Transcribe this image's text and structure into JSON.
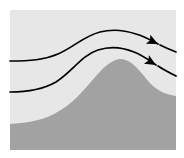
{
  "figure": {
    "type": "schematic-diagram",
    "width": 184,
    "height": 158
  },
  "canvas": {
    "outer_background": "#ffffff",
    "panel": {
      "label": "diagram-panel",
      "x": 10,
      "y": 10,
      "width": 166,
      "height": 140,
      "fill": "#e7e7e7"
    }
  },
  "colors": {
    "sky": "#e7e7e7",
    "terrain": "#a2a2a2",
    "streamline": "#000000",
    "arrowhead": "#000000",
    "background": "#ffffff"
  },
  "terrain": {
    "name": "mountain-ridge",
    "fill": "#a2a2a2",
    "description": "Broad asymmetric hill rising from a low left plateau to a rounded crest, then descending to the right edge",
    "left_base_y": 122,
    "crest_x": 120,
    "crest_y": 60,
    "right_edge_y": 96,
    "path": "M 10 150 L 10 124 C 26 123 40 121 54 114 C 72 105 84 90 96 76 C 106 65 112 60 120 59 C 129 59 136 66 144 76 C 153 88 162 94 176 96 L 176 150 Z"
  },
  "streamlines": [
    {
      "name": "upper-streamline",
      "id": "streamline-1",
      "stroke": "#000000",
      "stroke_width": 1.7,
      "entry_y": 61,
      "crest_y": 32,
      "exit_y": 47,
      "arrow": true,
      "path": "M 10 61 C 30 61 44 60 58 54 C 74 47 84 36 100 32 C 112 29 124 30 136 34 C 146 37 152 41 158 44"
    },
    {
      "name": "lower-streamline",
      "id": "streamline-2",
      "stroke": "#000000",
      "stroke_width": 1.7,
      "entry_y": 92,
      "crest_y": 49,
      "exit_y": 67,
      "arrow": true,
      "path": "M 10 92 C 28 92 42 90 56 82 C 72 72 82 55 98 50 C 110 46 122 47 134 52 C 144 56 150 61 156 65"
    }
  ],
  "arrowheads": [
    {
      "name": "upper-arrowhead",
      "tip_x": 158,
      "tip_y": 44,
      "angle_deg": 26,
      "length": 11,
      "half_width": 5,
      "fill": "#000000"
    },
    {
      "name": "lower-arrowhead",
      "tip_x": 156,
      "tip_y": 65,
      "angle_deg": 30,
      "length": 11,
      "half_width": 5,
      "fill": "#000000"
    }
  ],
  "tails": [
    {
      "name": "upper-streamline-tail",
      "path": "M 160 45 C 166 48 171 50 176 52",
      "stroke": "#000000",
      "stroke_width": 1.7
    },
    {
      "name": "lower-streamline-tail",
      "path": "M 158 66 C 164 70 170 73 176 76",
      "stroke": "#000000",
      "stroke_width": 1.7
    }
  ],
  "chart_data": {
    "type": "line",
    "xlabel": "",
    "ylabel": "",
    "xlim": [
      10,
      176
    ],
    "ylim": [
      150,
      10
    ],
    "grid": false,
    "legend": "none",
    "series": [
      {
        "name": "upper-streamline",
        "x": [
          10,
          34,
          58,
          82,
          100,
          120,
          136,
          150,
          158,
          176
        ],
        "y": [
          61,
          60,
          54,
          40,
          32,
          30,
          34,
          40,
          44,
          52
        ]
      },
      {
        "name": "lower-streamline",
        "x": [
          10,
          34,
          56,
          78,
          98,
          116,
          134,
          146,
          156,
          176
        ],
        "y": [
          92,
          91,
          82,
          62,
          50,
          47,
          52,
          59,
          65,
          76
        ]
      },
      {
        "name": "terrain-profile",
        "x": [
          10,
          30,
          54,
          76,
          96,
          110,
          120,
          132,
          144,
          158,
          176
        ],
        "y": [
          124,
          122,
          114,
          96,
          76,
          64,
          59,
          63,
          76,
          90,
          96
        ]
      }
    ],
    "annotations": [
      {
        "name": "upper-arrowhead",
        "x": 158,
        "y": 44,
        "symbol": "arrowhead",
        "direction": "right-down"
      },
      {
        "name": "lower-arrowhead",
        "x": 156,
        "y": 65,
        "symbol": "arrowhead",
        "direction": "right-down"
      }
    ]
  }
}
